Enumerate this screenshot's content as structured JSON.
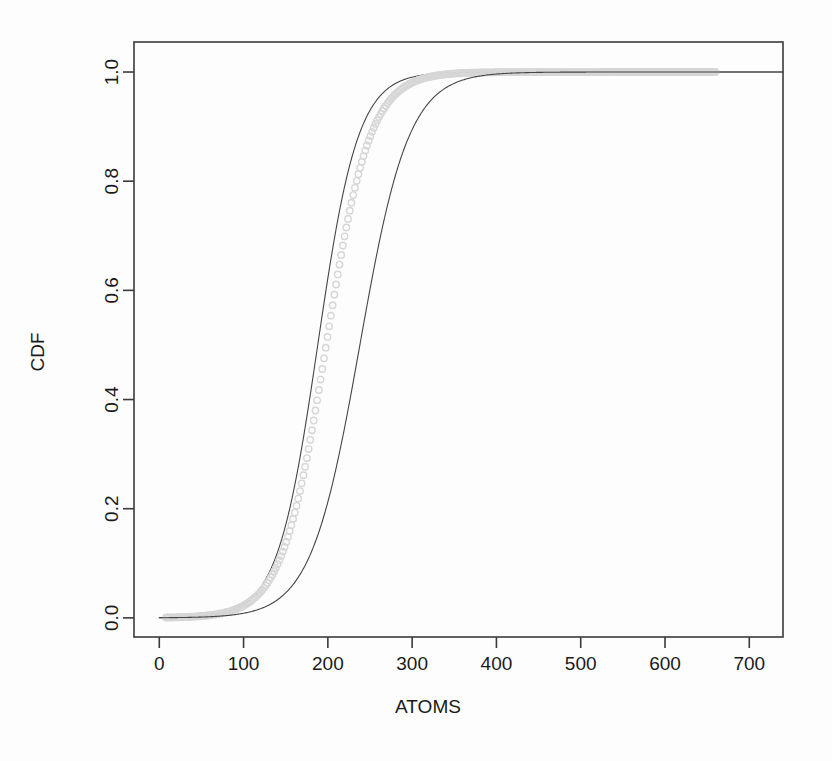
{
  "chart_data": {
    "type": "line",
    "title": "",
    "xlabel": "ATOMS",
    "ylabel": "CDF",
    "xlim": [
      -30,
      740
    ],
    "ylim": [
      -0.035,
      1.055
    ],
    "xticks": [
      0,
      100,
      200,
      300,
      400,
      500,
      600,
      700
    ],
    "xticklabels": [
      "0",
      "100",
      "200",
      "300",
      "400",
      "500",
      "600",
      "700"
    ],
    "yticks": [
      0.0,
      0.2,
      0.4,
      0.6,
      0.8,
      1.0
    ],
    "yticklabels": [
      "0.0",
      "0.2",
      "0.4",
      "0.6",
      "0.8",
      "1.0"
    ],
    "grid": false,
    "legend": "none",
    "background": "#ffffff",
    "frame_color": "#3a3a3a",
    "series": [
      {
        "name": "fitted-cdf-left",
        "style": "line",
        "color": "#454545",
        "linewidth": 1.1,
        "description": "left fitted logistic CDF curve, median near 188 atoms",
        "model": "logistic",
        "median": 188,
        "scale": 24,
        "x": [
          0,
          20,
          40,
          60,
          80,
          100,
          110,
          120,
          130,
          140,
          150,
          160,
          170,
          180,
          190,
          200,
          210,
          220,
          230,
          240,
          250,
          260,
          280,
          300,
          330,
          360,
          400,
          450,
          500,
          560,
          620,
          700
        ],
        "y": [
          0.0004,
          0.0009,
          0.002,
          0.0045,
          0.0102,
          0.0228,
          0.0341,
          0.0507,
          0.0748,
          0.1091,
          0.1564,
          0.2191,
          0.298,
          0.3906,
          0.4913,
          0.5922,
          0.6862,
          0.7682,
          0.8349,
          0.8861,
          0.9233,
          0.9494,
          0.9788,
          0.9911,
          0.9976,
          0.9993,
          0.9999,
          1.0,
          1.0,
          1.0,
          1.0,
          1.0
        ]
      },
      {
        "name": "empirical-cdf-data",
        "style": "markers",
        "color": "#d6d6d6",
        "markersize": 3.2,
        "description": "light grey empirical CDF of observed atom counts, plotted as small open circles",
        "median": 198,
        "scale": 26,
        "x_min": 8,
        "x_max": 660,
        "x": [
          8,
          40,
          70,
          95,
          110,
          120,
          130,
          140,
          150,
          160,
          170,
          180,
          190,
          200,
          210,
          220,
          230,
          240,
          250,
          260,
          270,
          285,
          300,
          320,
          345,
          375,
          410,
          450,
          500,
          560,
          610,
          660
        ],
        "y": [
          0.0005,
          0.0013,
          0.0035,
          0.009,
          0.016,
          0.023,
          0.033,
          0.047,
          0.068,
          0.097,
          0.136,
          0.188,
          0.254,
          0.333,
          0.421,
          0.512,
          0.6,
          0.681,
          0.751,
          0.809,
          0.855,
          0.907,
          0.942,
          0.972,
          0.988,
          0.995,
          0.9985,
          0.9996,
          0.9999,
          1.0,
          1.0,
          1.0
        ]
      },
      {
        "name": "fitted-cdf-right",
        "style": "line",
        "color": "#454545",
        "linewidth": 1.1,
        "description": "right fitted logistic CDF curve, median near 238 atoms",
        "model": "logistic",
        "median": 238,
        "scale": 29,
        "x": [
          0,
          40,
          80,
          100,
          120,
          140,
          150,
          160,
          170,
          180,
          190,
          200,
          210,
          220,
          230,
          240,
          250,
          260,
          270,
          280,
          300,
          320,
          340,
          370,
          400,
          440,
          490,
          550,
          620,
          700
        ],
        "y": [
          0.0003,
          0.0008,
          0.0022,
          0.0037,
          0.0063,
          0.0107,
          0.0139,
          0.018,
          0.0234,
          0.0302,
          0.039,
          0.0501,
          0.0641,
          0.0816,
          0.1034,
          0.13,
          0.1621,
          0.2,
          0.2437,
          0.2929,
          0.4035,
          0.5225,
          0.639,
          0.79,
          0.89,
          0.965,
          0.993,
          0.9992,
          0.9999,
          1.0
        ]
      }
    ]
  },
  "axes": {
    "y_title": "CDF",
    "x_title": "ATOMS"
  }
}
